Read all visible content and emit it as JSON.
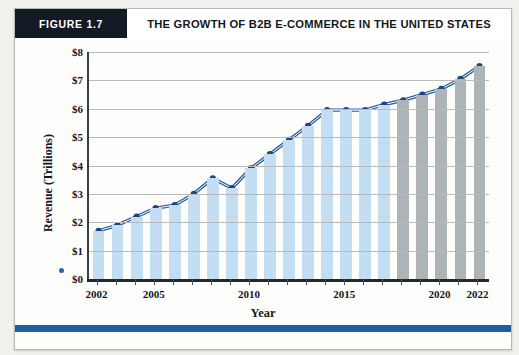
{
  "figure": {
    "tag": "FIGURE 1.7",
    "title": "THE GROWTH OF B2B E-COMMERCE IN THE UNITED STATES",
    "caption": ""
  },
  "colors": {
    "header_tag_bg": "#121a24",
    "historical_bar": "#c3ddf2",
    "forecast_bar": "#acb4b8",
    "line": "#2c5f9e",
    "marker": "#23457d",
    "bottom_rule": "#1f5fa0",
    "gridline": "#b7b9ba"
  },
  "chart_data": {
    "type": "line",
    "title": "THE GROWTH OF B2B E-COMMERCE IN THE UNITED STATES",
    "xlabel": "Year",
    "ylabel": "Revenue (Trillions)",
    "xlim": [
      2002,
      2022
    ],
    "ylim": [
      0,
      8
    ],
    "grid": true,
    "legend_position": "none",
    "ytick_labels": [
      "$0",
      "$1",
      "$2",
      "$3",
      "$4",
      "$5",
      "$6",
      "$7",
      "$8"
    ],
    "ytick_values": [
      0,
      1,
      2,
      3,
      4,
      5,
      6,
      7,
      8
    ],
    "xtick_labels": [
      "2002",
      "2005",
      "2010",
      "2015",
      "2020",
      "2022"
    ],
    "xtick_values": [
      2002,
      2005,
      2010,
      2015,
      2020,
      2022
    ],
    "categories": [
      2002,
      2003,
      2004,
      2005,
      2006,
      2007,
      2008,
      2009,
      2010,
      2011,
      2012,
      2013,
      2014,
      2015,
      2016,
      2017,
      2018,
      2019,
      2020,
      2021,
      2022
    ],
    "values": [
      1.7,
      1.9,
      2.2,
      2.5,
      2.6,
      3.0,
      3.55,
      3.2,
      3.9,
      4.4,
      4.9,
      5.4,
      5.95,
      5.95,
      5.95,
      6.15,
      6.3,
      6.5,
      6.7,
      7.05,
      7.5
    ],
    "bar_kinds": [
      "hist",
      "hist",
      "hist",
      "hist",
      "hist",
      "hist",
      "hist",
      "hist",
      "hist",
      "hist",
      "hist",
      "hist",
      "hist",
      "hist",
      "hist",
      "hist",
      "fcst",
      "fcst",
      "fcst",
      "fcst",
      "fcst"
    ],
    "series": [
      {
        "name": "Revenue (Trillions)",
        "values": [
          1.7,
          1.9,
          2.2,
          2.5,
          2.6,
          3.0,
          3.55,
          3.2,
          3.9,
          4.4,
          4.9,
          5.4,
          5.95,
          5.95,
          5.95,
          6.15,
          6.3,
          6.5,
          6.7,
          7.05,
          7.5
        ]
      }
    ],
    "forecast_start_year": 2018,
    "annotations": []
  }
}
